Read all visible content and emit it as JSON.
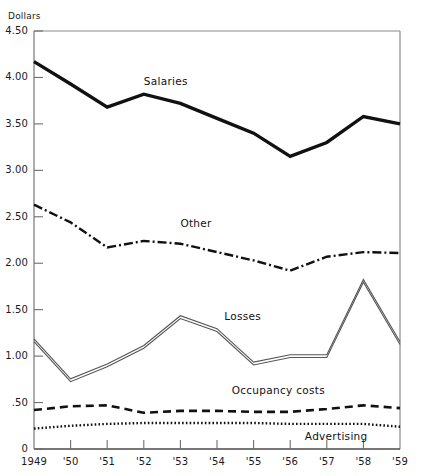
{
  "chart_data": {
    "type": "line",
    "title": "",
    "xlabel": "",
    "ylabel": "Dollars",
    "ylim": [
      0,
      4.5
    ],
    "grid": false,
    "legend_position": "inline-annotations",
    "categories": [
      "1949",
      "'50",
      "'51",
      "'52",
      "'53",
      "'54",
      "'55",
      "'56",
      "'57",
      "'58",
      "'59"
    ],
    "x": [
      1949,
      1950,
      1951,
      1952,
      1953,
      1954,
      1955,
      1956,
      1957,
      1958,
      1959
    ],
    "ytick_labels": [
      "0",
      ".50",
      "1.00",
      "1.50",
      "2.00",
      "2.50",
      "3.00",
      "3.50",
      "4.00",
      "4.50"
    ],
    "ytick_values": [
      0,
      0.5,
      1.0,
      1.5,
      2.0,
      2.5,
      3.0,
      3.5,
      4.0,
      4.5
    ],
    "series": [
      {
        "name": "Salaries",
        "style": "solid-thick",
        "color": "#111111",
        "values": [
          4.17,
          3.93,
          3.68,
          3.82,
          3.72,
          3.56,
          3.4,
          3.15,
          3.3,
          3.58,
          3.5
        ],
        "label_x": 1952.0,
        "label_y": 3.95
      },
      {
        "name": "Other",
        "style": "dash-dot",
        "color": "#111111",
        "values": [
          2.63,
          2.44,
          2.17,
          2.24,
          2.21,
          2.12,
          2.03,
          1.92,
          2.07,
          2.12,
          2.11
        ],
        "label_x": 1953.0,
        "label_y": 2.42
      },
      {
        "name": "Losses",
        "style": "double-thin",
        "color": "#555555",
        "values": [
          1.17,
          0.74,
          0.9,
          1.1,
          1.42,
          1.28,
          0.92,
          1.0,
          1.0,
          1.81,
          1.14
        ],
        "label_x": 1954.2,
        "label_y": 1.42
      },
      {
        "name": "Occupancy costs",
        "style": "dashed",
        "color": "#111111",
        "values": [
          0.42,
          0.46,
          0.47,
          0.39,
          0.41,
          0.41,
          0.4,
          0.4,
          0.43,
          0.47,
          0.44
        ],
        "label_x": 1954.4,
        "label_y": 0.62
      },
      {
        "name": "Advertising",
        "style": "dotted",
        "color": "#111111",
        "values": [
          0.22,
          0.25,
          0.27,
          0.28,
          0.28,
          0.28,
          0.28,
          0.27,
          0.27,
          0.27,
          0.24
        ],
        "label_x": 1956.4,
        "label_y": 0.13
      }
    ]
  },
  "axis": {
    "unit_label": "Dollars"
  }
}
